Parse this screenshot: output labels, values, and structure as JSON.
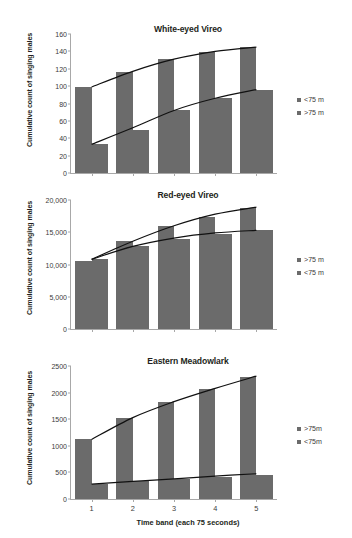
{
  "figure": {
    "xlabel": "Time band (each 75 seconds)",
    "ylabel": "Cumulative count of singing males",
    "bar_color": "#6b6b6b",
    "axis_color": "#a8a8a8"
  },
  "chart_data": [
    {
      "type": "bar",
      "title": "White-eyed Vireo",
      "xlabel": "",
      "ylabel": "Cumulative count of singing males",
      "categories": [
        "1",
        "2",
        "3",
        "4",
        "5"
      ],
      "ylim": [
        0,
        160
      ],
      "yticks": [
        0,
        20,
        40,
        60,
        80,
        100,
        120,
        140,
        160
      ],
      "ytick_labels": [
        "0",
        "20",
        "40",
        "60",
        "80",
        "100",
        "120",
        "140",
        "160"
      ],
      "grid": false,
      "legend_position": "right",
      "legend": [
        "<75 m",
        ">75 m"
      ],
      "series": [
        {
          "name": "<75 m",
          "values": [
            99,
            116,
            131,
            139,
            145
          ]
        },
        {
          "name": ">75 m",
          "values": [
            33,
            50,
            73,
            86,
            95
          ]
        }
      ],
      "trendlines": [
        {
          "name": "<75 m trend",
          "points": [
            [
              1,
              99
            ],
            [
              2,
              117
            ],
            [
              3,
              131
            ],
            [
              4,
              140
            ],
            [
              5,
              145
            ]
          ]
        },
        {
          "name": ">75 m trend",
          "points": [
            [
              1,
              33
            ],
            [
              2,
              52
            ],
            [
              3,
              72
            ],
            [
              4,
              86
            ],
            [
              5,
              96
            ]
          ]
        }
      ]
    },
    {
      "type": "bar",
      "title": "Red-eyed Vireo",
      "xlabel": "",
      "ylabel": "Cumulative count of singing males",
      "categories": [
        "1",
        "2",
        "3",
        "4",
        "5"
      ],
      "ylim": [
        0,
        20000
      ],
      "yticks": [
        0,
        5000,
        10000,
        15000,
        20000
      ],
      "ytick_labels": [
        "0",
        "5,000",
        "10,000",
        "15,000",
        "20,000"
      ],
      "grid": false,
      "legend_position": "right",
      "legend": [
        ">75 m",
        "<75 m"
      ],
      "series": [
        {
          "name": ">75 m",
          "values": [
            10600,
            13700,
            16000,
            17400,
            18800
          ]
        },
        {
          "name": "<75 m",
          "values": [
            10900,
            12900,
            14000,
            14800,
            15300
          ]
        }
      ],
      "trendlines": [
        {
          "name": ">75 m trend",
          "points": [
            [
              1,
              10800
            ],
            [
              2,
              13600
            ],
            [
              3,
              16000
            ],
            [
              4,
              17800
            ],
            [
              5,
              18900
            ]
          ]
        },
        {
          "name": "<75 m trend",
          "points": [
            [
              1,
              10800
            ],
            [
              2,
              12800
            ],
            [
              3,
              14100
            ],
            [
              4,
              14900
            ],
            [
              5,
              15300
            ]
          ]
        }
      ]
    },
    {
      "type": "bar",
      "title": "Eastern Meadowlark",
      "xlabel": "Time band (each 75 seconds)",
      "ylabel": "Cumulative count of singing males",
      "categories": [
        "1",
        "2",
        "3",
        "4",
        "5"
      ],
      "ylim": [
        0,
        2500
      ],
      "yticks": [
        0,
        500,
        1000,
        1500,
        2000,
        2500
      ],
      "ytick_labels": [
        "0",
        "500",
        "1000",
        "1500",
        "2000",
        "2500"
      ],
      "grid": false,
      "legend_position": "right",
      "legend": [
        ">75m",
        "<75m"
      ],
      "series": [
        {
          "name": ">75m",
          "values": [
            1120,
            1520,
            1820,
            2070,
            2300
          ]
        },
        {
          "name": "<75m",
          "values": [
            280,
            330,
            370,
            420,
            460
          ]
        }
      ],
      "trendlines": [
        {
          "name": ">75m trend",
          "points": [
            [
              1,
              1120
            ],
            [
              2,
              1530
            ],
            [
              3,
              1830
            ],
            [
              4,
              2080
            ],
            [
              5,
              2310
            ]
          ]
        },
        {
          "name": "<75m trend",
          "points": [
            [
              1,
              280
            ],
            [
              2,
              330
            ],
            [
              3,
              380
            ],
            [
              4,
              430
            ],
            [
              5,
              475
            ]
          ]
        }
      ]
    }
  ]
}
